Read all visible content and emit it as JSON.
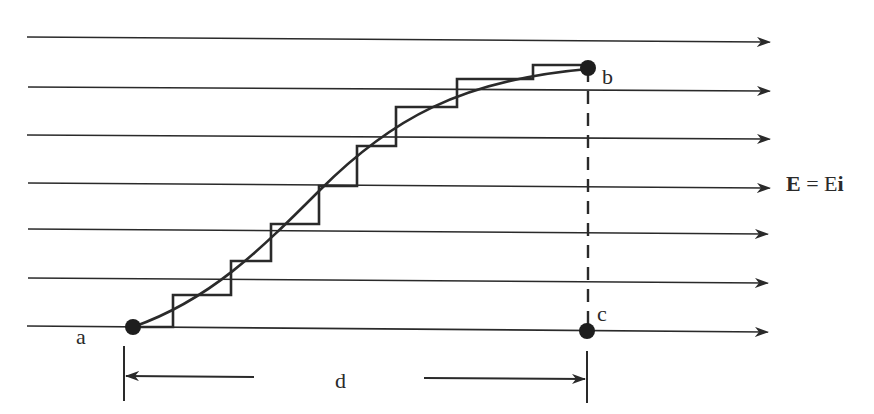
{
  "figure": {
    "colors": {
      "ink": "#2a2a2a",
      "background": "#ffffff"
    },
    "field": {
      "label_bold": "E",
      "label_equals": " = ",
      "label_rest": "E",
      "label_unit_vector": "i",
      "line_count": 7,
      "direction": "right"
    },
    "points": {
      "a": {
        "label": "a"
      },
      "b": {
        "label": "b"
      },
      "c": {
        "label": "c"
      }
    },
    "dimension": {
      "label": "d",
      "from": "a",
      "to": "c"
    },
    "paths": {
      "curve": "smooth path a to b",
      "staircase": "step approximation of path a to b",
      "dashed": "vertical dashed line b to c"
    }
  }
}
